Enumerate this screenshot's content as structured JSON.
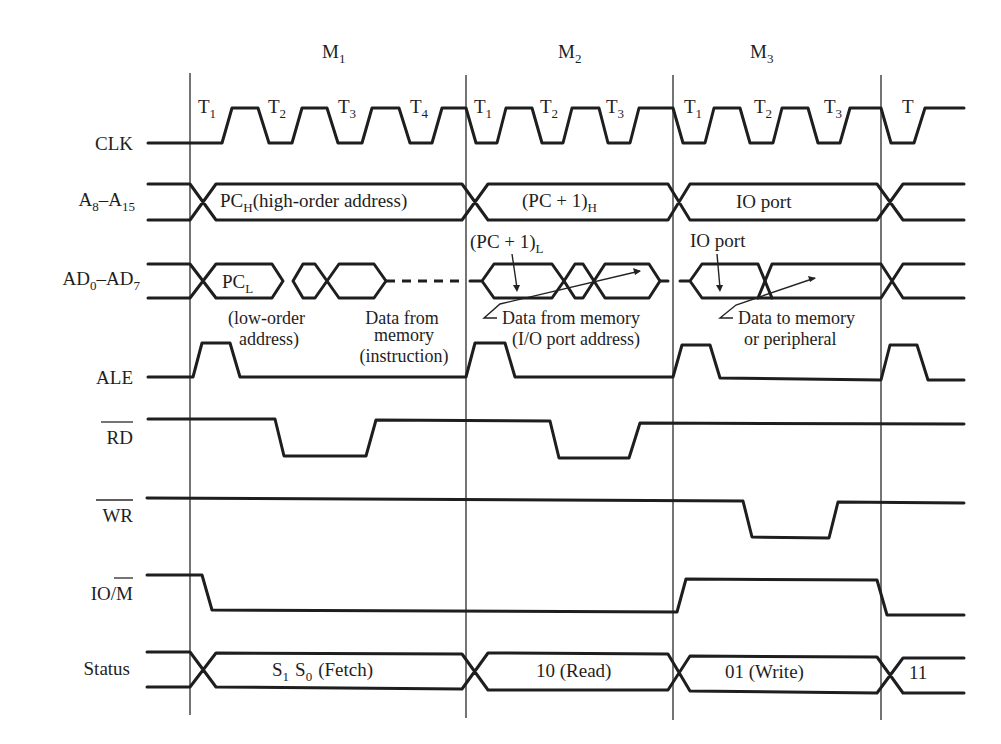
{
  "machine_cycles": [
    {
      "label": "M",
      "sub": "1"
    },
    {
      "label": "M",
      "sub": "2"
    },
    {
      "label": "M",
      "sub": "3"
    }
  ],
  "t_states": [
    {
      "label": "T",
      "sub": "1"
    },
    {
      "label": "T",
      "sub": "2"
    },
    {
      "label": "T",
      "sub": "3"
    },
    {
      "label": "T",
      "sub": "4"
    },
    {
      "label": "T",
      "sub": "1"
    },
    {
      "label": "T",
      "sub": "2"
    },
    {
      "label": "T",
      "sub": "3"
    },
    {
      "label": "T",
      "sub": "1"
    },
    {
      "label": "T",
      "sub": "2"
    },
    {
      "label": "T",
      "sub": "3"
    },
    {
      "label": "T",
      "sub": ""
    }
  ],
  "signals": {
    "clk": "CLK",
    "addr_high": {
      "main": "A",
      "sub1": "8",
      "dash": "–A",
      "sub2": "15"
    },
    "addr_data": {
      "main": "AD",
      "sub1": "0",
      "dash": "–AD",
      "sub2": "7"
    },
    "ale": "ALE",
    "rd": "RD",
    "wr": "WR",
    "io_m": {
      "prefix": "IO/",
      "bar": "M"
    },
    "status": "Status"
  },
  "bus_labels": {
    "a8_m1": {
      "main": "PC",
      "sub": "H",
      "rest": "(high-order address)"
    },
    "a8_m2": {
      "main": "(PC  +  1)",
      "sub": "H"
    },
    "a8_m3": "IO port",
    "ad_m1": {
      "main": "PC",
      "sub": "L"
    },
    "ad_m2_top": {
      "main": "(PC  +  1)",
      "sub": "L"
    },
    "ad_m3_top": "IO port"
  },
  "notes": {
    "low_order": [
      "(low-order",
      "address)"
    ],
    "data_from_memory_m1": [
      "Data  from",
      "memory",
      "(instruction)"
    ],
    "data_from_memory_m2": [
      "Data  from  memory",
      "(I/O port address)"
    ],
    "data_to_memory_m3": [
      "Data  to  memory",
      "or  peripheral"
    ]
  },
  "status_values": {
    "m1": {
      "s1": "S",
      "s1sub": "1",
      "s0": "S",
      "s0sub": "0",
      "rest": "(Fetch)"
    },
    "m2": "10 (Read)",
    "m3": "01 (Write)",
    "next": "11"
  }
}
